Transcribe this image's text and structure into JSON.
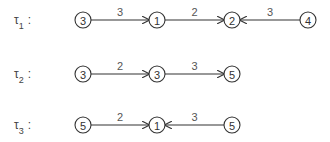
{
  "rows": [
    {
      "label": "τ",
      "subscript": "1",
      "colon": ":",
      "y": 20,
      "nodes": [
        {
          "value": "3",
          "x": 83
        },
        {
          "value": "1",
          "x": 157
        },
        {
          "value": "2",
          "x": 232
        },
        {
          "value": "4",
          "x": 308
        }
      ],
      "edges": [
        {
          "from": 0,
          "to": 1,
          "weight": "3"
        },
        {
          "from": 2,
          "to": 1,
          "weight": "2",
          "direction": "forward",
          "fromIdx": 1,
          "toIdx": 2
        },
        {
          "from": 3,
          "to": 2,
          "weight": "3"
        }
      ]
    },
    {
      "label": "τ",
      "subscript": "2",
      "colon": ":",
      "y": 74,
      "nodes": [
        {
          "value": "3",
          "x": 83
        },
        {
          "value": "3",
          "x": 157
        },
        {
          "value": "5",
          "x": 232
        }
      ],
      "edges": [
        {
          "from": 0,
          "to": 1,
          "weight": "2"
        },
        {
          "from": 1,
          "to": 2,
          "weight": "3"
        }
      ]
    },
    {
      "label": "τ",
      "subscript": "3",
      "colon": ":",
      "y": 125,
      "nodes": [
        {
          "value": "5",
          "x": 83
        },
        {
          "value": "1",
          "x": 157
        },
        {
          "value": "5",
          "x": 232
        }
      ],
      "edges": [
        {
          "from": 0,
          "to": 1,
          "weight": "2"
        },
        {
          "from": 2,
          "to": 1,
          "weight": "3"
        }
      ]
    }
  ],
  "colors": {
    "stroke": "#333333",
    "text": "#444444"
  }
}
